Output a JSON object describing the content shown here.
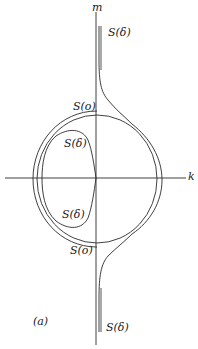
{
  "figure": {
    "panel_label": "(a)",
    "axes": {
      "horizontal_label": "k",
      "vertical_label": "m"
    },
    "curves": [
      {
        "id": "separatrix-outer",
        "label": "S(δ)",
        "description": "outer separatrix, vertical tails at top and bottom wrapping around circle"
      },
      {
        "id": "circle-s0",
        "label": "S(o)",
        "description": "circle orbit crossing m-axis top and bottom"
      },
      {
        "id": "inner-loop",
        "label": "S(δ)",
        "description": "inner loop on left half touching m-axis at origin"
      }
    ],
    "labels": {
      "s_delta_top": "S(δ)",
      "s_zero_top": "S(o)",
      "s_delta_inner_upper": "S(δ)",
      "s_delta_inner_lower": "S(δ)",
      "s_zero_bottom": "S(o)",
      "s_delta_bottom": "S(δ)"
    },
    "colors": {
      "stroke": "#2a2a2a",
      "background": "#ffffff"
    }
  }
}
